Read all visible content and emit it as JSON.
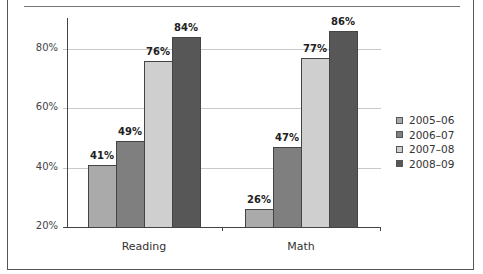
{
  "chart_data": {
    "type": "bar",
    "title": "",
    "xlabel": "",
    "ylabel": "",
    "ylim": [
      20,
      86
    ],
    "yticks": [
      "20%",
      "40%",
      "60%",
      "80%"
    ],
    "categories": [
      "Reading",
      "Math"
    ],
    "series": [
      {
        "name": "2005–06",
        "values": [
          41,
          26
        ],
        "labels": [
          "41%",
          "26%"
        ],
        "color": "#aaaaaa"
      },
      {
        "name": "2006–07",
        "values": [
          49,
          47
        ],
        "labels": [
          "49%",
          "47%"
        ],
        "color": "#7f7f7f"
      },
      {
        "name": "2007–08",
        "values": [
          76,
          77
        ],
        "labels": [
          "76%",
          "77%"
        ],
        "color": "#cfcfcf"
      },
      {
        "name": "2008–09",
        "values": [
          84,
          86
        ],
        "labels": [
          "84%",
          "86%"
        ],
        "color": "#575757"
      }
    ],
    "grid": true,
    "legend_position": "right"
  }
}
